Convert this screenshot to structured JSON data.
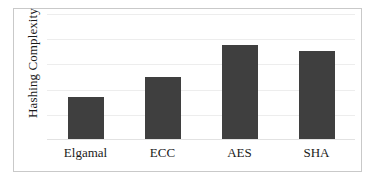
{
  "chart_data": {
    "type": "bar",
    "title": "",
    "subtitle": "",
    "xlabel": "",
    "ylabel": "Hashing Complexity",
    "categories": [
      "Elgamal",
      "ECC",
      "AES",
      "SHA"
    ],
    "values": [
      34,
      50,
      75,
      71
    ],
    "ylim": [
      0,
      100
    ],
    "grid": true,
    "gridline_values": [
      20,
      40,
      60,
      80,
      100
    ],
    "legend": null,
    "legend_position": "none",
    "tick_labels_y": [],
    "annotations": [],
    "series": [
      {
        "name": "Hashing Complexity",
        "values": [
          34,
          50,
          75,
          71
        ],
        "color": "#3f3f3f"
      }
    ]
  },
  "style": {
    "bar_color": "#3f3f3f",
    "gridline_color": "#ededed",
    "frame_color": "#c9c9c9",
    "background_color": "#ffffff",
    "text_color": "#1a1a1a"
  }
}
